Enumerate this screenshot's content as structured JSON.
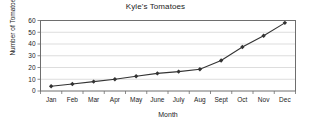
{
  "chart_data": {
    "type": "line",
    "title": "Kyle's Tomatoes",
    "xlabel": "Month",
    "ylabel": "Number of Tomatoes",
    "categories": [
      "Jan",
      "Feb",
      "Mar",
      "Apr",
      "May",
      "June",
      "July",
      "Aug",
      "Sept",
      "Oct",
      "Nov",
      "Dec"
    ],
    "values": [
      4,
      6,
      8,
      10,
      12.5,
      15,
      16.5,
      18.5,
      26,
      37.5,
      47,
      58
    ],
    "ylim": [
      0,
      60
    ],
    "yticks": [
      0,
      10,
      20,
      30,
      40,
      50,
      60
    ],
    "grid": true,
    "legend": false,
    "series_color": "#333333",
    "marker": "diamond",
    "gridline_color": "#d4d4d4",
    "axis_color": "#6e6e6e",
    "background_color": "#ffffff"
  }
}
